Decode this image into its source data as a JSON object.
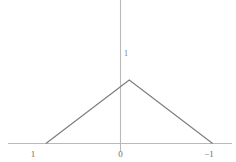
{
  "figure": {
    "background_color": "#ffffff",
    "axis_color": "#b9b9b9",
    "curve_color": "#7d7d7d",
    "label_color": "#6e6e6e",
    "width": 236,
    "height": 162
  },
  "axes": {
    "x_axis_name": "horizontal-axis",
    "y_axis_name": "vertical-axis",
    "x_axis_y_px": 143.5,
    "y_axis_x_px": 120.5,
    "x_axis_start_px": 8,
    "x_axis_end_px": 232,
    "y_axis_top_px": 0,
    "y_axis_bottom_px": 152
  },
  "ticks": {
    "x": [
      {
        "label": "1",
        "x_px": 33
      },
      {
        "label": "0",
        "x_px": 120.5
      },
      {
        "label": "−1",
        "x_px": 209
      }
    ]
  },
  "annotations": {
    "apex": {
      "label": "1",
      "x_px": 124,
      "y_px": 54
    }
  },
  "chart_data": {
    "type": "line",
    "title": "",
    "xlabel": "",
    "ylabel": "",
    "x": [
      1,
      0,
      -1
    ],
    "values": [
      0,
      1,
      0
    ],
    "series": [
      {
        "name": "tent-function",
        "x": [
          1,
          0,
          -1
        ],
        "values": [
          0,
          1,
          0
        ]
      }
    ],
    "xlim": [
      1.55,
      -1.28
    ],
    "ylim": [
      -0.1,
      2.45
    ],
    "x_tick_labels": [
      "1",
      "0",
      "−1"
    ],
    "x_tick_values": [
      1,
      0,
      -1
    ],
    "y_tick_labels": [],
    "y_tick_values": [],
    "annotations": [
      "1"
    ],
    "grid": false,
    "legend": false,
    "legend_position": "none",
    "x_axis_reversed": true
  }
}
